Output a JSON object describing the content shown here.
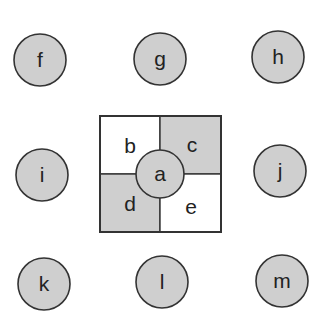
{
  "diagram": {
    "center_node": {
      "label": "a"
    },
    "quadrants": [
      {
        "label": "b",
        "shaded": false
      },
      {
        "label": "c",
        "shaded": true
      },
      {
        "label": "d",
        "shaded": true
      },
      {
        "label": "e",
        "shaded": false
      }
    ],
    "outer_nodes": [
      {
        "label": "f"
      },
      {
        "label": "g"
      },
      {
        "label": "h"
      },
      {
        "label": "i"
      },
      {
        "label": "j"
      },
      {
        "label": "k"
      },
      {
        "label": "l"
      },
      {
        "label": "m"
      }
    ],
    "colors": {
      "shaded": "#cfcfcf",
      "stroke": "#333333",
      "background": "#ffffff"
    }
  }
}
